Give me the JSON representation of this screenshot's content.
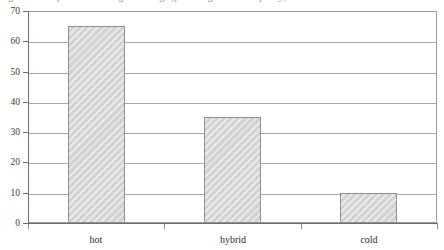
{
  "caption": {
    "clipped_line": "Figure 4. Comparison of storage tier usage (percentage of total capacity)."
  },
  "chart_data": {
    "type": "bar",
    "title": "",
    "xlabel": "",
    "ylabel": "",
    "categories": [
      "hot",
      "hybrid",
      "cold"
    ],
    "values": [
      65,
      35,
      10
    ],
    "series": [
      {
        "name": "series1",
        "values": [
          65,
          35,
          10
        ]
      }
    ],
    "ylim": [
      0,
      70
    ],
    "ytick_step": 10,
    "yticks": [
      70,
      60,
      50,
      40,
      30,
      20,
      10,
      0
    ],
    "ytick_labels": [
      "70",
      "60",
      "50",
      "40",
      "30",
      "20",
      "10",
      "0"
    ],
    "grid": true,
    "grid_axis": "y",
    "legend": false,
    "legend_position": "none",
    "bar_fill_color": "#d9d9d9",
    "bar_border_color": "#8f8f8f",
    "axis_color": "#6f6f6f",
    "gridline_color": "#a8a8a8",
    "plot_background": "#ffffff"
  }
}
